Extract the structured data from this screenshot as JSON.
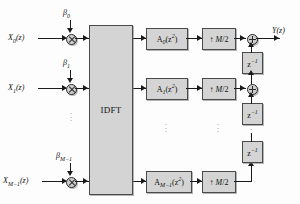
{
  "diagram": {
    "idft_label": "IDFT",
    "output_label": "Y(z)",
    "colors": {
      "block_fill": "#d4d4d4",
      "block_border": "#4a4a4a",
      "wire": "#1a1a1a",
      "background": "#fdfdfd",
      "ellipsis": "#8d8d8d"
    },
    "rows": [
      {
        "input_label": "X₀(z)",
        "gain_label": "β₀",
        "filter_label": "A₀(z²)",
        "upsampler_label": "↑ M/2",
        "multiplier_icon": "circle-times-icon",
        "adder_icon": "circle-plus-icon"
      },
      {
        "input_label": "X₁(z)",
        "gain_label": "β₁",
        "filter_label": "A₁(z²)",
        "upsampler_label": "↑ M/2",
        "multiplier_icon": "circle-times-icon",
        "adder_icon": "circle-plus-icon"
      },
      {
        "input_label": "X_{M-1}(z)",
        "gain_label": "β_{M-1}",
        "filter_label": "A_{M-1}(z²)",
        "upsampler_label": "↑ M/2",
        "multiplier_icon": "circle-times-icon",
        "adder_icon": "none"
      }
    ],
    "delays": [
      {
        "label": "z⁻¹"
      },
      {
        "label": "z⁻¹"
      },
      {
        "label": "z⁻¹"
      }
    ],
    "ellipsis_glyph": "⋮"
  }
}
